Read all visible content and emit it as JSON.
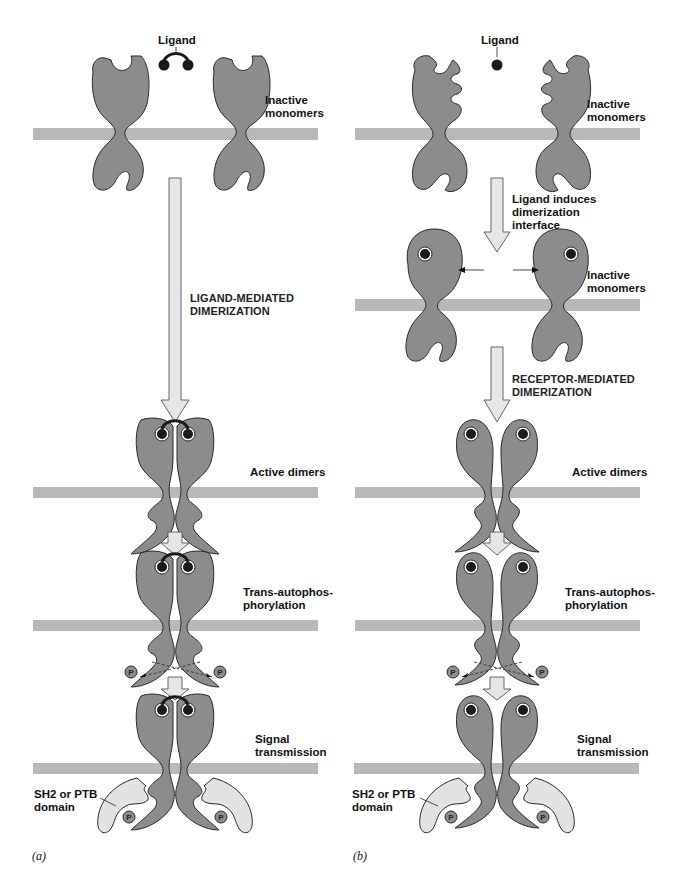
{
  "figure": {
    "colors": {
      "protein": "#8c8c8c",
      "protein_stroke": "#2a2a2a",
      "membrane": "#b8b8b8",
      "arrow_fill": "#e6e6e6",
      "arrow_stroke": "#555555",
      "ligand": "#1a1a1a",
      "adapter": "#e2e2e2",
      "phospho": "#8c8c8c"
    }
  },
  "panel_a": {
    "label": "(a)",
    "ligand_label": "Ligand",
    "step1_label_line1": "Inactive",
    "step1_label_line2": "monomers",
    "transition_label_line1": "LIGAND-MEDIATED",
    "transition_label_line2": "DIMERIZATION",
    "step2_label": "Active dimers",
    "step3_label_line1": "Trans-autophos-",
    "step3_label_line2": "phorylation",
    "step4_label_line1": "Signal",
    "step4_label_line2": "transmission",
    "adapter_label_line1": "SH2 or PTB",
    "adapter_label_line2": "domain",
    "phospho_symbol": "P"
  },
  "panel_b": {
    "label": "(b)",
    "ligand_label": "Ligand",
    "step1_label_line1": "Inactive",
    "step1_label_line2": "monomers",
    "induce_label_line1": "Ligand induces",
    "induce_label_line2": "dimerization",
    "induce_label_line3": "interface",
    "step1b_label_line1": "Inactive",
    "step1b_label_line2": "monomers",
    "transition_label_line1": "RECEPTOR-MEDIATED",
    "transition_label_line2": "DIMERIZATION",
    "step2_label": "Active dimers",
    "step3_label_line1": "Trans-autophos-",
    "step3_label_line2": "phorylation",
    "step4_label_line1": "Signal",
    "step4_label_line2": "transmission",
    "adapter_label_line1": "SH2 or PTB",
    "adapter_label_line2": "domain",
    "phospho_symbol": "P"
  }
}
